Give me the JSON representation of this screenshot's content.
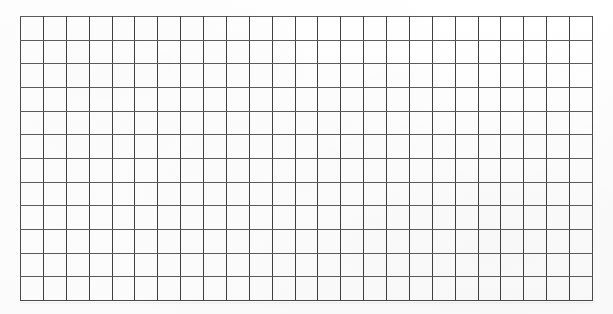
{
  "document": {
    "type": "blank-grid-worksheet",
    "title": "",
    "background_color": "#ffffff",
    "line_color": "#4a4a4a"
  },
  "grid": {
    "columns": 25,
    "rows": 12,
    "cell_width_px": 23,
    "cell_height_px": 24,
    "left_px": 20,
    "top_px": 16,
    "width_px": 573,
    "height_px": 285,
    "cells_total": 300,
    "cell_text": ""
  },
  "labels": {
    "column_headers": [],
    "row_headers": [],
    "caption": ""
  }
}
